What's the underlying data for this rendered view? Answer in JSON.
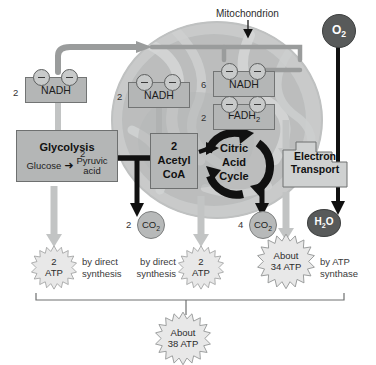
{
  "diagram": {
    "organelle_label": "Mitochondrion",
    "colors": {
      "box_fill": "#b4b6b6",
      "box_stroke": "#6e7070",
      "dark_molecule": "#585a5a",
      "light_molecule": "#b7b9b9",
      "gray_pipe": "#9a9c9c",
      "black_arrow": "#111111",
      "burst_fill": "#e6e6e6",
      "burst_stroke": "#8a8c8c"
    }
  },
  "carriers": {
    "glycolysis_nadh": {
      "count": "2",
      "label": "NADH",
      "electron_symbol": "e-"
    },
    "acetyl_nadh": {
      "count": "2",
      "label": "NADH",
      "electron_symbol": "e-"
    },
    "cycle_nadh": {
      "count": "6",
      "label": "NADH",
      "electron_symbol": "e-"
    },
    "cycle_fadh2": {
      "count": "2",
      "label_main": "FADH",
      "label_sub": "2",
      "electron_symbol": "e-"
    }
  },
  "stages": {
    "glycolysis": {
      "title": "Glycolysis",
      "input": "Glucose",
      "arrow": "➜",
      "output_count": "2",
      "output_line1": "Pyruvic",
      "output_line2": "acid"
    },
    "acetyl_coa": {
      "count": "2",
      "line1": "Acetyl",
      "line2": "CoA"
    },
    "citric_acid_cycle": {
      "line1": "Citric",
      "line2": "Acid",
      "line3": "Cycle"
    },
    "electron_transport": {
      "line1": "Electron",
      "line2": "Transport"
    }
  },
  "molecules": {
    "oxygen": {
      "formula_main": "O",
      "formula_sub": "2"
    },
    "co2_glycolysis_stage": {
      "count": "2",
      "formula_main": "CO",
      "formula_sub": "2"
    },
    "co2_cycle_stage": {
      "count": "4",
      "formula_main": "CO",
      "formula_sub": "2"
    },
    "water": {
      "formula_pre": "H",
      "formula_sub": "2",
      "formula_post": "O"
    }
  },
  "atp_yields": {
    "glycolysis": {
      "count": "2",
      "unit": "ATP",
      "method_line1": "by direct",
      "method_line2": "synthesis"
    },
    "citric_acid_cycle": {
      "count": "2",
      "unit": "ATP",
      "method_line1": "by direct",
      "method_line2": "synthesis"
    },
    "electron_transport": {
      "approx": "About",
      "count": "34 ATP",
      "method_line1": "by ATP",
      "method_line2": "synthase"
    },
    "total": {
      "approx": "About",
      "count": "38 ATP"
    }
  }
}
